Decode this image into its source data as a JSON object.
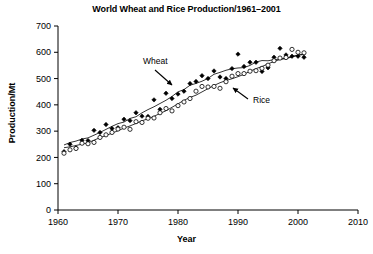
{
  "chart_data": {
    "type": "scatter",
    "title": "World Wheat and Rice Production/1961–2001",
    "xlabel": "Year",
    "ylabel": "Production/Mt",
    "xlim": [
      1960,
      2010
    ],
    "ylim": [
      0,
      700
    ],
    "xticks": [
      1960,
      1970,
      1980,
      1990,
      2000,
      2010
    ],
    "yticks": [
      0,
      100,
      200,
      300,
      400,
      500,
      600,
      700
    ],
    "grid": false,
    "legend": "none",
    "annotations": [
      {
        "text": "Wheat",
        "target_series": "Wheat",
        "x": 1976.5,
        "y": 540,
        "arrow": "down-right"
      },
      {
        "text": "Rice",
        "target_series": "Rice",
        "x": 1994.0,
        "y": 400,
        "arrow": "up-left"
      }
    ],
    "x": [
      1961,
      1962,
      1963,
      1964,
      1965,
      1966,
      1967,
      1968,
      1969,
      1970,
      1971,
      1972,
      1973,
      1974,
      1975,
      1976,
      1977,
      1978,
      1979,
      1980,
      1981,
      1982,
      1983,
      1984,
      1985,
      1986,
      1987,
      1988,
      1989,
      1990,
      1991,
      1992,
      1993,
      1994,
      1995,
      1996,
      1997,
      1998,
      1999,
      2000,
      2001
    ],
    "series": [
      {
        "name": "Wheat",
        "marker": "filled-diamond",
        "color": "#000000",
        "trendline": true,
        "values": [
          222,
          250,
          236,
          265,
          264,
          303,
          295,
          325,
          310,
          313,
          345,
          340,
          370,
          357,
          356,
          419,
          383,
          444,
          424,
          441,
          452,
          481,
          489,
          511,
          500,
          529,
          506,
          500,
          538,
          593,
          546,
          562,
          562,
          527,
          541,
          581,
          615,
          590,
          585,
          585,
          581
        ]
      },
      {
        "name": "Rice",
        "marker": "open-circle",
        "color": "#000000",
        "trendline": true,
        "values": [
          216,
          229,
          234,
          254,
          252,
          257,
          276,
          286,
          295,
          308,
          315,
          307,
          336,
          333,
          349,
          350,
          370,
          386,
          377,
          397,
          411,
          424,
          452,
          470,
          468,
          470,
          463,
          488,
          509,
          519,
          519,
          528,
          530,
          539,
          551,
          568,
          578,
          580,
          611,
          600,
          598
        ]
      }
    ]
  },
  "figure": {
    "title": "World Wheat and Rice Production/1961–2001",
    "x_axis_label": "Year",
    "y_axis_label": "Production/Mt"
  }
}
